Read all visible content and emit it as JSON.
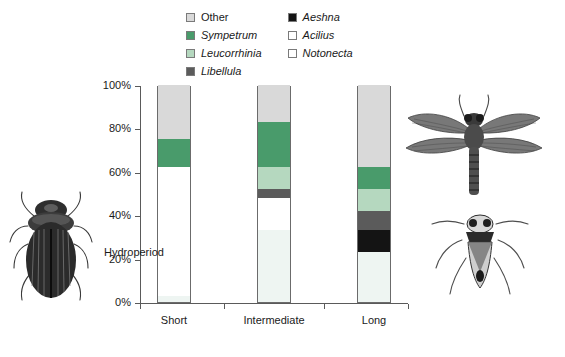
{
  "chart_data": {
    "type": "bar",
    "subtype": "stacked-percentage",
    "title": "",
    "xlabel": "Hydroperiod",
    "ylabel": "",
    "categories": [
      "Short",
      "Intermediate",
      "Long"
    ],
    "ylim": [
      0,
      100
    ],
    "ytick_labels": [
      "0%",
      "20%",
      "40%",
      "60%",
      "80%",
      "100%"
    ],
    "ytick_values": [
      0,
      20,
      40,
      60,
      80,
      100
    ],
    "grid": false,
    "legend_position": "top",
    "stack_order_bottom_to_top": [
      "Notonecta",
      "Acilius",
      "Aeshna",
      "Libellula",
      "Leucorrhinia",
      "Sympetrum",
      "Other"
    ],
    "series": [
      {
        "name": "Notonecta",
        "color": "#eef5f2",
        "values": [
          3,
          33,
          23
        ]
      },
      {
        "name": "Acilius",
        "color": "#ffffff",
        "values": [
          59,
          15,
          0
        ]
      },
      {
        "name": "Aeshna",
        "color": "#141414",
        "values": [
          0,
          0,
          10
        ]
      },
      {
        "name": "Libellula",
        "color": "#5b5b5b",
        "values": [
          0,
          4,
          9
        ]
      },
      {
        "name": "Leucorrhinia",
        "color": "#b5d8bf",
        "values": [
          0,
          10,
          10
        ]
      },
      {
        "name": "Sympetrum",
        "color": "#499b6b",
        "values": [
          13,
          21,
          10
        ]
      },
      {
        "name": "Other",
        "color": "#d9d9d9",
        "values": [
          25,
          17,
          38
        ]
      }
    ]
  },
  "legend": {
    "columns": [
      [
        {
          "label": "Other",
          "icon": "legend-swatch-other",
          "color": "#d9d9d9",
          "italic": false
        },
        {
          "label": "Sympetrum",
          "icon": "legend-swatch-sympetrum",
          "color": "#499b6b",
          "italic": true
        },
        {
          "label": "Leucorrhinia",
          "icon": "legend-swatch-leucorrhinia",
          "color": "#b5d8bf",
          "italic": true
        },
        {
          "label": "Libellula",
          "icon": "legend-swatch-libellula",
          "color": "#5b5b5b",
          "italic": true
        }
      ],
      [
        {
          "label": "Aeshna",
          "icon": "legend-swatch-aeshna",
          "color": "#141414",
          "italic": true
        },
        {
          "label": "Acilius",
          "icon": "legend-swatch-acilius",
          "color": "#ffffff",
          "italic": true
        },
        {
          "label": "Notonecta",
          "icon": "legend-swatch-notonecta",
          "color": "#ffffff",
          "italic": true
        }
      ]
    ]
  },
  "illustrations": [
    {
      "name": "diving-beetle-illustration",
      "subject": "Acilius diving beetle"
    },
    {
      "name": "dragonfly-illustration",
      "subject": "adult dragonfly"
    },
    {
      "name": "backswimmer-illustration",
      "subject": "Notonecta backswimmer"
    }
  ]
}
